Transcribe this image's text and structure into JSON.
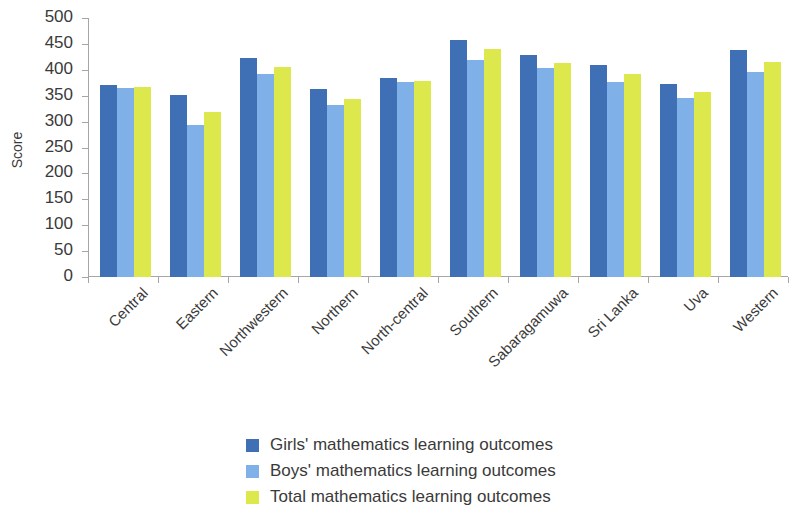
{
  "chart_data": {
    "type": "bar",
    "title": "",
    "subtitle": "",
    "xlabel": "",
    "ylabel": "Score",
    "ylim": [
      0,
      500
    ],
    "ytick_step": 50,
    "yticks": [
      500,
      450,
      400,
      350,
      300,
      250,
      200,
      150,
      100,
      50,
      0
    ],
    "grid": false,
    "legend_position": "bottom-center",
    "categories": [
      "Central",
      "Eastern",
      "Northwestern",
      "Northern",
      "North-central",
      "Southern",
      "Sabaragamuwa",
      "Sri Lanka",
      "Uva",
      "Western"
    ],
    "series": [
      {
        "name": "Girls' mathematics learning outcomes",
        "color": "#3f6fb5",
        "values": [
          370,
          351,
          423,
          363,
          384,
          458,
          428,
          409,
          373,
          438
        ]
      },
      {
        "name": "Boys' mathematics learning outcomes",
        "color": "#80b0e8",
        "values": [
          365,
          293,
          392,
          332,
          376,
          419,
          403,
          377,
          346,
          396
        ]
      },
      {
        "name": "Total mathematics learning outcomes",
        "color": "#dde84d",
        "values": [
          366,
          319,
          406,
          343,
          379,
          440,
          414,
          391,
          357,
          416
        ]
      }
    ]
  },
  "axis": {
    "y_title": "Score"
  },
  "colors": {
    "girls": "#3f6fb5",
    "boys": "#80b0e8",
    "total": "#dde84d",
    "axis": "#a6a6a6",
    "text": "#3a3a3a",
    "background": "#ffffff"
  }
}
